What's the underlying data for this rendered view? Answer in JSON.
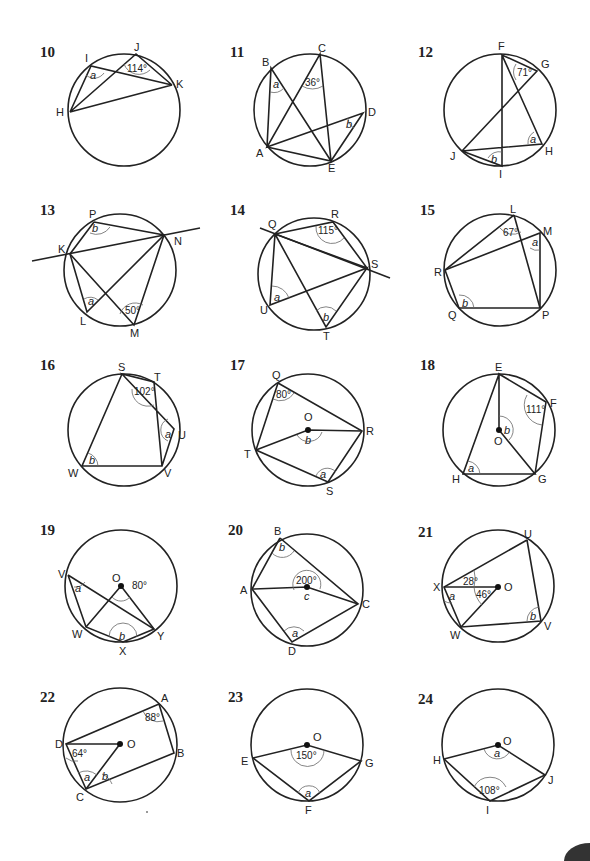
{
  "problems": [
    {
      "number": "10",
      "points": [
        "I",
        "J",
        "K",
        "H"
      ],
      "given_angle": "114°",
      "unknowns": [
        "a"
      ]
    },
    {
      "number": "11",
      "points": [
        "A",
        "B",
        "C",
        "D",
        "E"
      ],
      "given_angle": "36°",
      "unknowns": [
        "a",
        "b"
      ]
    },
    {
      "number": "12",
      "points": [
        "F",
        "G",
        "H",
        "I",
        "J"
      ],
      "given_angle": "71°",
      "unknowns": [
        "a",
        "b"
      ]
    },
    {
      "number": "13",
      "points": [
        "P",
        "K",
        "N",
        "L",
        "M"
      ],
      "given_angle": "50°",
      "unknowns": [
        "a",
        "b"
      ]
    },
    {
      "number": "14",
      "points": [
        "Q",
        "R",
        "S",
        "T",
        "U"
      ],
      "given_angle": "115°",
      "unknowns": [
        "a",
        "b"
      ]
    },
    {
      "number": "15",
      "points": [
        "L",
        "M",
        "R",
        "Q",
        "P"
      ],
      "given_angle": "67°",
      "unknowns": [
        "a",
        "b"
      ]
    },
    {
      "number": "16",
      "points": [
        "S",
        "T",
        "U",
        "V",
        "W"
      ],
      "given_angle": "102°",
      "unknowns": [
        "a",
        "b"
      ]
    },
    {
      "number": "17",
      "points": [
        "Q",
        "O",
        "R",
        "T",
        "S"
      ],
      "given_angle": "80°",
      "unknowns": [
        "a",
        "b"
      ]
    },
    {
      "number": "18",
      "points": [
        "E",
        "F",
        "O",
        "H",
        "G"
      ],
      "given_angle": "111°",
      "unknowns": [
        "a",
        "b"
      ]
    },
    {
      "number": "19",
      "points": [
        "V",
        "O",
        "W",
        "X",
        "Y"
      ],
      "given_angle": "80°",
      "unknowns": [
        "a",
        "b"
      ]
    },
    {
      "number": "20",
      "points": [
        "B",
        "A",
        "C",
        "D"
      ],
      "given_angle": "200°",
      "unknowns": [
        "a",
        "b",
        "c"
      ]
    },
    {
      "number": "21",
      "points": [
        "U",
        "X",
        "O",
        "W",
        "V"
      ],
      "given_angles": [
        "28°",
        "46°"
      ],
      "unknowns": [
        "a",
        "b"
      ]
    },
    {
      "number": "22",
      "points": [
        "A",
        "D",
        "O",
        "B",
        "C"
      ],
      "given_angles": [
        "88°",
        "64°"
      ],
      "unknowns": [
        "a",
        "b"
      ]
    },
    {
      "number": "23",
      "points": [
        "O",
        "E",
        "G",
        "F"
      ],
      "given_angle": "150°",
      "unknowns": [
        "a"
      ]
    },
    {
      "number": "24",
      "points": [
        "O",
        "H",
        "J",
        "I"
      ],
      "given_angle": "108°",
      "unknowns": [
        "a"
      ]
    }
  ]
}
